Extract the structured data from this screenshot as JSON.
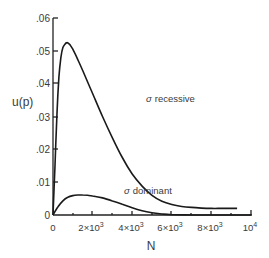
{
  "chart_data": {
    "type": "line",
    "title": "",
    "xlabel": "N",
    "ylabel": "u(p)",
    "xlim": [
      0,
      10000
    ],
    "ylim": [
      0,
      0.06
    ],
    "grid": false,
    "legend": "none (inline curve labels)",
    "x_ticks": [
      0,
      2000,
      4000,
      6000,
      8000,
      10000
    ],
    "x_tick_labels": [
      "0",
      "2×10³",
      "4×10³",
      "6×10³",
      "8×10³",
      "10⁴"
    ],
    "y_ticks": [
      0,
      0.01,
      0.02,
      0.03,
      0.04,
      0.05,
      0.06
    ],
    "y_tick_labels": [
      "0",
      ".01",
      ".02",
      ".03",
      ".04",
      ".05",
      ".06"
    ],
    "series": [
      {
        "name": "σ recessive",
        "label": "σ recessive",
        "x": [
          0,
          100,
          200,
          300,
          400,
          500,
          600,
          700,
          800,
          900,
          1000,
          1200,
          1500,
          2000,
          2500,
          3000,
          3500,
          4000,
          4500,
          5000,
          5500,
          6000,
          6500,
          7000,
          7500,
          8000,
          8500,
          9000,
          9300
        ],
        "values": [
          0,
          0.015,
          0.031,
          0.042,
          0.048,
          0.051,
          0.052,
          0.0525,
          0.0522,
          0.0515,
          0.0505,
          0.048,
          0.044,
          0.037,
          0.03,
          0.0235,
          0.0175,
          0.0125,
          0.0088,
          0.006,
          0.0042,
          0.0032,
          0.0026,
          0.0023,
          0.0021,
          0.002,
          0.002,
          0.002,
          0.002
        ]
      },
      {
        "name": "σ dominant",
        "label": "σ dominant",
        "x": [
          0,
          250,
          500,
          750,
          1000,
          1250,
          1500,
          1750,
          2000,
          2500,
          3000,
          3500,
          4000,
          4500,
          5000,
          5500,
          6000,
          7000,
          8000,
          9000,
          10000
        ],
        "values": [
          0,
          0.0025,
          0.0043,
          0.0054,
          0.0059,
          0.0061,
          0.0061,
          0.006,
          0.0058,
          0.0052,
          0.0043,
          0.0033,
          0.0022,
          0.0013,
          0.0007,
          0.0003,
          0.0001,
          0.0,
          0.0,
          0.0,
          0.0
        ]
      }
    ],
    "annotations": [
      {
        "text": "σ recessive",
        "x": 4700,
        "y": 0.036
      },
      {
        "text": "σ dominant",
        "x": 4400,
        "y": 0.0075
      }
    ]
  },
  "labels": {
    "ylabel": "u(p)",
    "xlabel": "N",
    "recessive_prefix": "σ",
    "recessive_word": "recessive",
    "dominant_prefix": "σ",
    "dominant_word": "dominant",
    "y_ticks": [
      ".06",
      ".05",
      ".04",
      ".03",
      ".02",
      ".01",
      "0"
    ],
    "x_ticks": [
      "0",
      "2×10",
      "4×10",
      "6×10",
      "8×10",
      "10"
    ],
    "x_tick_exps": [
      "",
      "3",
      "3",
      "3",
      "3",
      "4"
    ]
  }
}
